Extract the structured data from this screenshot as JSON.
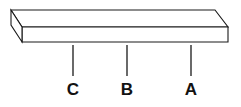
{
  "figure": {
    "background_color": "#ffffff",
    "line_color": "#1a1a1a",
    "label_color": "#121212",
    "face_fill": "#ffffff",
    "width": 241,
    "height": 107
  },
  "object": {
    "name": "rectangular-bar",
    "shape": "3d-rectangular-prism",
    "top_face": {
      "name": "top-face",
      "points": "11,10 215,10 228,27 22,27"
    },
    "front_face": {
      "name": "front-face",
      "points": "22,27 228,27 228,42 22,42"
    },
    "left_end_face": {
      "name": "left-end-face",
      "points": "11,10 22,27 22,42 11,25"
    }
  },
  "callouts": [
    {
      "id": "callout-c",
      "label": "C",
      "line_x": 73,
      "line_y_top": 45,
      "line_y_bottom": 76,
      "label_x": 73,
      "label_y": 95
    },
    {
      "id": "callout-b",
      "label": "B",
      "line_x": 127,
      "line_y_top": 45,
      "line_y_bottom": 76,
      "label_x": 127,
      "label_y": 95
    },
    {
      "id": "callout-a",
      "label": "A",
      "line_x": 191,
      "line_y_top": 45,
      "line_y_bottom": 76,
      "label_x": 191,
      "label_y": 95
    }
  ]
}
